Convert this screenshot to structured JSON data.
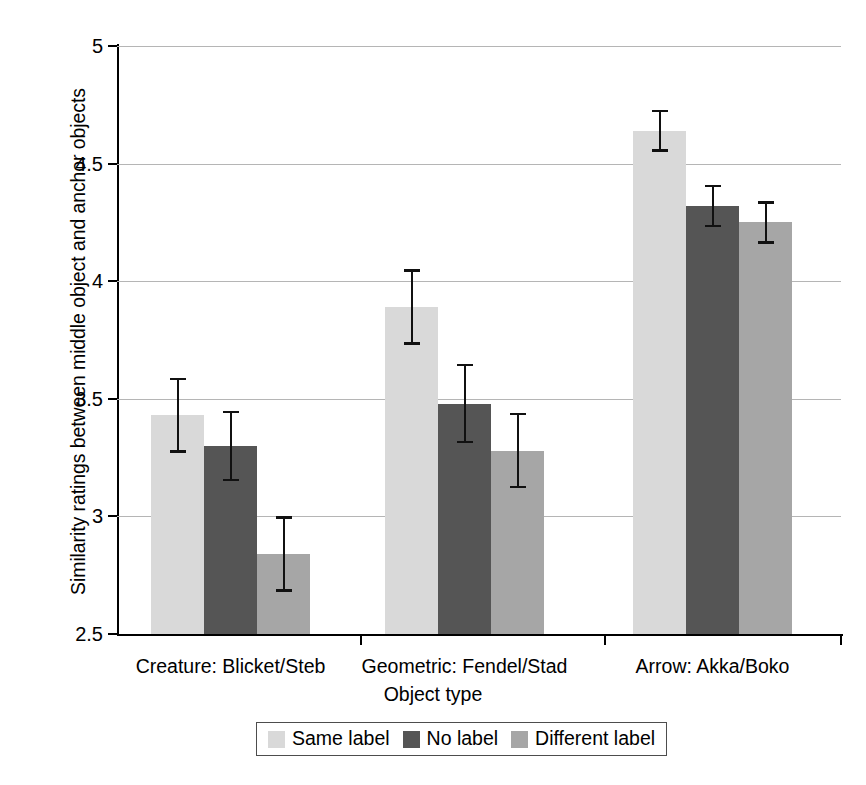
{
  "chart_data": {
    "type": "bar",
    "title": "",
    "xlabel": "Object type",
    "ylabel": "Similarity ratings between middle object and anchor objects",
    "ylim": [
      2.5,
      5
    ],
    "yticks": [
      "2.5",
      "3",
      "3.5",
      "4",
      "4.5",
      "5"
    ],
    "ytick_values": [
      2.5,
      3,
      3.5,
      4,
      4.5,
      5
    ],
    "grid": true,
    "legend_position": "bottom",
    "categories": [
      "Creature: Blicket/Steb",
      "Geometric: Fendel/Stad",
      "Arrow: Akka/Boko"
    ],
    "series": [
      {
        "name": "Same label",
        "color": "#d9d9d9",
        "values": [
          3.43,
          3.89,
          4.64
        ],
        "errors": [
          0.16,
          0.16,
          0.09
        ]
      },
      {
        "name": "No label",
        "color": "#555555",
        "values": [
          3.3,
          3.48,
          4.32
        ],
        "errors": [
          0.15,
          0.17,
          0.09
        ]
      },
      {
        "name": "Different label",
        "color": "#a6a6a6",
        "values": [
          2.84,
          3.28,
          4.25
        ],
        "errors": [
          0.16,
          0.16,
          0.09
        ]
      }
    ]
  },
  "legend": {
    "items": [
      {
        "label": "Same label",
        "color": "#d9d9d9"
      },
      {
        "label": "No label",
        "color": "#555555"
      },
      {
        "label": "Different label",
        "color": "#a6a6a6"
      }
    ]
  },
  "axes": {
    "y_title": "Similarity ratings between middle object and anchor objects",
    "x_title": "Object type"
  }
}
